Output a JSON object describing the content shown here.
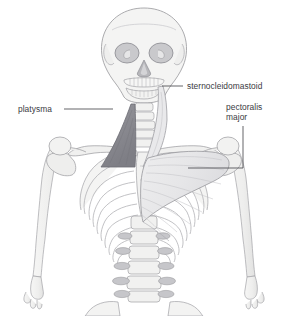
{
  "figure": {
    "background_color": "#ffffff",
    "width": 288,
    "height": 316
  },
  "palette": {
    "background": "#ffffff",
    "bone_fill": "#f3f3f2",
    "bone_fill_shadow": "#e4e4e3",
    "bone_outline": "#9a9a9e",
    "bone_outline_light": "#b9b9bd",
    "muscle_platysma": "#8a8a90",
    "muscle_platysma_outline": "#6e6e74",
    "muscle_sternocleidomastoid": "#e8e8ea",
    "muscle_pectoralis": "#e9e9ea",
    "muscle_pectoralis_striation": "#c4c4c8",
    "leader_line": "#4a4a4e",
    "label_text": "#3b3b3f"
  },
  "labels": [
    {
      "id": "sternocleidomastoid",
      "text": "sternocleidomastoid",
      "lines": [
        "sternocleidomastoid"
      ],
      "x": 187,
      "y": 81,
      "leader": {
        "type": "horizontal",
        "from_x": 183,
        "from_y": 86,
        "to_x": 162,
        "to_y": 86
      }
    },
    {
      "id": "platysma",
      "text": "platysma",
      "lines": [
        "platysma"
      ],
      "x": 18,
      "y": 104,
      "leader": {
        "type": "horizontal",
        "from_x": 64,
        "from_y": 109,
        "to_x": 113,
        "to_y": 109
      }
    },
    {
      "id": "pectoralis-major",
      "text": "pectoralis major",
      "lines": [
        "pectoralis",
        "major"
      ],
      "x": 226,
      "y": 102,
      "leader": {
        "type": "elbow",
        "from_x": 243,
        "from_y": 126,
        "corner_x": 243,
        "corner_y": 168,
        "to_x": 188,
        "to_y": 168
      }
    }
  ],
  "anatomy": {
    "structures": [
      "skull",
      "mandible",
      "cervical vertebrae",
      "clavicle",
      "scapula",
      "sternum",
      "rib cage",
      "humerus",
      "radius",
      "ulna",
      "lumbar vertebrae",
      "ilium"
    ],
    "muscles": [
      "platysma",
      "sternocleidomastoid",
      "pectoralis major"
    ]
  }
}
